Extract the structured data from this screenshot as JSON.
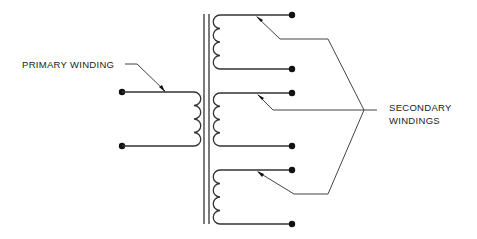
{
  "diagram": {
    "type": "transformer-schematic",
    "labels": {
      "primary": "PRIMARY WINDING",
      "secondary_line1": "SECONDARY",
      "secondary_line2": "WINDINGS"
    },
    "primary_winding": {
      "terminals": 2,
      "coil_turns": 4
    },
    "secondary_windings": [
      {
        "id": "secondary-1",
        "terminals": 2,
        "coil_turns": 4
      },
      {
        "id": "secondary-2",
        "terminals": 2,
        "coil_turns": 4
      },
      {
        "id": "secondary-3",
        "terminals": 2,
        "coil_turns": 4
      }
    ],
    "core": "double-line iron core",
    "colors": {
      "line": "#333333",
      "background": "#ffffff"
    }
  }
}
